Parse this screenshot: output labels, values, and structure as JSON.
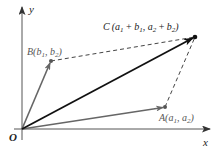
{
  "diagram": {
    "colors": {
      "axis": "#555555",
      "vector_a": "#666666",
      "vector_b": "#666666",
      "vector_sum": "#111111",
      "dashed": "#444444",
      "point": "#555555",
      "point_c": "#111111"
    },
    "axes": {
      "x_label": "x",
      "y_label": "y",
      "origin_label": "O"
    },
    "points": {
      "A": {
        "name": "A",
        "open": "(",
        "c1": "a",
        "s1": "1",
        "sep": ", ",
        "c2": "a",
        "s2": "2",
        "close": ")"
      },
      "B": {
        "name": "B",
        "open": "(",
        "c1": "b",
        "s1": "1",
        "sep": ", ",
        "c2": "b",
        "s2": "2",
        "close": ")"
      },
      "C": {
        "name": "C",
        "open": "(",
        "t1": "a",
        "t1s": "1",
        "plus1": " + ",
        "t2": "b",
        "t2s": "1",
        "sep": ", ",
        "t3": "a",
        "t3s": "2",
        "plus2": " + ",
        "t4": "b",
        "t4s": "2",
        "close": ")"
      }
    }
  }
}
